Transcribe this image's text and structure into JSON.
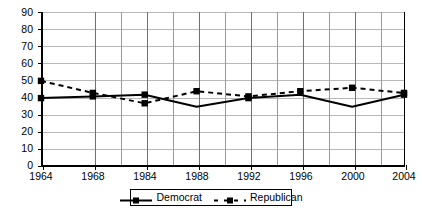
{
  "chart_data": {
    "type": "line",
    "title": "",
    "subtitle": "",
    "xlabel": "",
    "ylabel": "",
    "xlim": [
      1964,
      2004
    ],
    "ylim": [
      0,
      90
    ],
    "grid": true,
    "legend_position": "bottom-center",
    "x_tick_labels": [
      "1964",
      "1968",
      "1984",
      "1988",
      "1992",
      "1996",
      "2000",
      "2004"
    ],
    "x_tick_values": [
      1964,
      1968,
      1984,
      1988,
      1992,
      1996,
      2000,
      2004
    ],
    "y_tick_labels": [
      "0",
      "10",
      "20",
      "30",
      "40",
      "50",
      "60",
      "70",
      "80",
      "90"
    ],
    "y_tick_values": [
      0,
      10,
      20,
      30,
      40,
      50,
      60,
      70,
      80,
      90
    ],
    "categories": [
      1964,
      1968,
      1984,
      1988,
      1992,
      1996,
      2000,
      2004
    ],
    "series": [
      {
        "name": "Democrat",
        "style": "solid",
        "marker": "square",
        "color": "#000000",
        "values": [
          40,
          41,
          42,
          35,
          40,
          42,
          35,
          42
        ],
        "marked_points": [
          1964,
          1968,
          1984,
          1992,
          2004
        ]
      },
      {
        "name": "Republican",
        "style": "dashed",
        "marker": "square",
        "color": "#000000",
        "values": [
          50,
          43,
          37,
          44,
          41,
          44,
          46,
          43
        ],
        "marked_points": [
          1964,
          1968,
          1984,
          1988,
          1992,
          1996,
          2000,
          2004
        ]
      }
    ]
  },
  "legend": {
    "items": [
      {
        "label": "Democrat",
        "style": "solid"
      },
      {
        "label": "Republican",
        "style": "dashed"
      }
    ]
  }
}
